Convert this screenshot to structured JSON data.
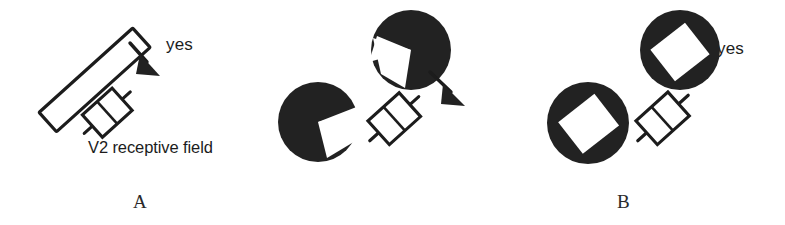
{
  "figure": {
    "background_color": "#ffffff",
    "ink_color": "#1c1c1c",
    "width": 785,
    "height": 225
  },
  "panels": [
    {
      "id": "A",
      "letter": "A",
      "answer": "yes",
      "caption": "V2 receptive field",
      "stimulus": "outlined elongated bar",
      "contour": "real luminance edge",
      "arrow": "points to receptive field from bar edge"
    },
    {
      "id": "B",
      "letter": "B",
      "answer": "yes",
      "caption": "",
      "stimulus": "two pac-man inducers with notches facing each other",
      "contour": "illusory contour",
      "arrow": "points to receptive field from illusory edge"
    },
    {
      "id": "C",
      "letter": "C",
      "answer": "no",
      "caption": "",
      "stimulus": "two discs with internal white rectangular slots",
      "contour": "no contour",
      "arrow": "none"
    }
  ],
  "colors": {
    "ink": "#1c1c1c",
    "fill_black": "#222222",
    "paper": "#ffffff"
  },
  "icons": {
    "receptive_field": "receptive-field-icon",
    "arrow": "arrow-icon",
    "pacman": "pacman-inducer-icon",
    "disc_slot": "slotted-disc-icon",
    "bar": "outlined-bar-icon"
  }
}
